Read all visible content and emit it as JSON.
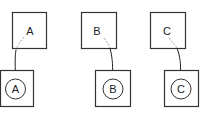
{
  "diagram": {
    "type": "mapping",
    "colors": {
      "stroke": "#333333",
      "text": "#222222",
      "dashed_connector": "#888888",
      "background": "#ffffff"
    },
    "pairs": [
      {
        "source_label": "A",
        "target_label": "A"
      },
      {
        "source_label": "B",
        "target_label": "B"
      },
      {
        "source_label": "C",
        "target_label": "C"
      }
    ]
  }
}
